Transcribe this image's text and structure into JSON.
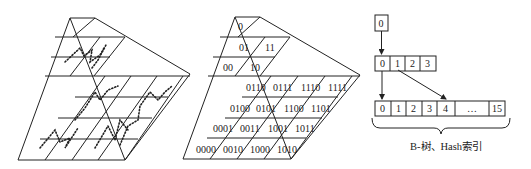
{
  "figure": {
    "panels": [
      {
        "name": "pyramid-space-filling-curve",
        "description": "Pyramid of grid levels with dotted Z-order curves"
      },
      {
        "name": "pyramid-quadkey-labels",
        "level0": [
          "0"
        ],
        "level1": [
          "00",
          "01",
          "10",
          "11"
        ],
        "level2_rows": [
          [
            "0110",
            "0111",
            "1110",
            "1111"
          ],
          [
            "0100",
            "0101",
            "1100",
            "1101"
          ],
          [
            "0001",
            "0011",
            "1001",
            "1011"
          ],
          [
            "0000",
            "0010",
            "1000",
            "1010"
          ]
        ]
      },
      {
        "name": "index-tree",
        "root": [
          "0"
        ],
        "level1": [
          "0",
          "1",
          "2",
          "3"
        ],
        "level2": [
          "0",
          "1",
          "2",
          "3",
          "4",
          "…",
          "15"
        ],
        "caption": "B-树、Hash索引"
      }
    ]
  }
}
